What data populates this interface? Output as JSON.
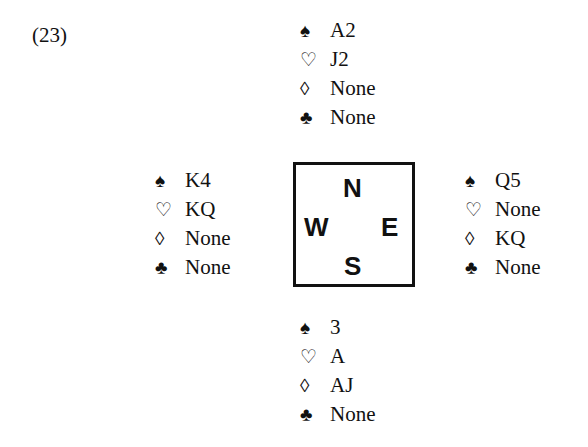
{
  "problem_number": "(23)",
  "suits": {
    "spades": "♠",
    "hearts": "♡",
    "diamonds": "◊",
    "clubs": "♣"
  },
  "compass": {
    "north": "N",
    "west": "W",
    "east": "E",
    "south": "S"
  },
  "hands": {
    "north": {
      "spades": "A2",
      "hearts": "J2",
      "diamonds": "None",
      "clubs": "None"
    },
    "west": {
      "spades": "K4",
      "hearts": "KQ",
      "diamonds": "None",
      "clubs": "None"
    },
    "east": {
      "spades": "Q5",
      "hearts": "None",
      "diamonds": "KQ",
      "clubs": "None"
    },
    "south": {
      "spades": "3",
      "hearts": "A",
      "diamonds": "AJ",
      "clubs": "None"
    }
  }
}
